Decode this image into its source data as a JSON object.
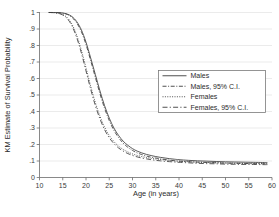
{
  "chart_data": {
    "type": "line",
    "title": "",
    "xlabel": "Age (in years)",
    "ylabel": "KM Estimate of Survival Probability",
    "xlim": [
      10,
      60
    ],
    "ylim": [
      0,
      1
    ],
    "xticks": [
      "10",
      "15",
      "20",
      "25",
      "30",
      "35",
      "40",
      "45",
      "50",
      "55",
      "60"
    ],
    "xtick_values": [
      10,
      15,
      20,
      25,
      30,
      35,
      40,
      45,
      50,
      55,
      60
    ],
    "yticks": [
      "0",
      ".1",
      ".2",
      ".3",
      ".4",
      ".5",
      ".6",
      ".7",
      ".8",
      ".9",
      "1"
    ],
    "ytick_values": [
      0,
      0.1,
      0.2,
      0.3,
      0.4,
      0.5,
      0.6,
      0.7,
      0.8,
      0.9,
      1
    ],
    "grid": "horizontal",
    "legend_position": "center-right",
    "legend": [
      {
        "label": "Males",
        "style": "solid"
      },
      {
        "label": "Males, 95% C.I.",
        "style": "dashdot"
      },
      {
        "label": "Females",
        "style": "dotted"
      },
      {
        "label": "Females, 95% C.I.",
        "style": "longdash"
      }
    ],
    "x": [
      12,
      13,
      14,
      15,
      16,
      17,
      18,
      19,
      20,
      21,
      22,
      23,
      24,
      25,
      26,
      27,
      28,
      29,
      30,
      31,
      32,
      33,
      34,
      35,
      36,
      37,
      38,
      39,
      40,
      42,
      44,
      46,
      48,
      50,
      52,
      54,
      56,
      58,
      59
    ],
    "series": [
      {
        "name": "Males",
        "style": "solid",
        "values": [
          1.0,
          1.0,
          0.999,
          0.997,
          0.99,
          0.975,
          0.945,
          0.895,
          0.82,
          0.725,
          0.625,
          0.525,
          0.435,
          0.36,
          0.3,
          0.255,
          0.22,
          0.195,
          0.175,
          0.16,
          0.149,
          0.14,
          0.133,
          0.127,
          0.122,
          0.118,
          0.114,
          0.111,
          0.108,
          0.104,
          0.101,
          0.099,
          0.097,
          0.095,
          0.094,
          0.093,
          0.092,
          0.091,
          0.091
        ]
      },
      {
        "name": "Males, 95% C.I.",
        "style": "dashdot",
        "values": [
          1.0,
          1.0,
          0.999,
          0.996,
          0.988,
          0.97,
          0.937,
          0.884,
          0.806,
          0.709,
          0.608,
          0.508,
          0.419,
          0.345,
          0.286,
          0.242,
          0.208,
          0.183,
          0.164,
          0.149,
          0.139,
          0.13,
          0.123,
          0.118,
          0.113,
          0.109,
          0.105,
          0.102,
          0.099,
          0.096,
          0.093,
          0.091,
          0.089,
          0.087,
          0.086,
          0.085,
          0.084,
          0.083,
          0.083
        ]
      },
      {
        "name": "Females",
        "style": "dotted",
        "values": [
          1.0,
          0.999,
          0.996,
          0.988,
          0.968,
          0.928,
          0.862,
          0.772,
          0.665,
          0.555,
          0.455,
          0.372,
          0.305,
          0.255,
          0.218,
          0.19,
          0.17,
          0.155,
          0.143,
          0.134,
          0.127,
          0.121,
          0.116,
          0.112,
          0.109,
          0.106,
          0.103,
          0.101,
          0.099,
          0.096,
          0.093,
          0.091,
          0.09,
          0.088,
          0.087,
          0.086,
          0.086,
          0.085,
          0.085
        ]
      },
      {
        "name": "Females, 95% C.I.",
        "style": "longdash",
        "values": [
          1.0,
          0.999,
          0.995,
          0.985,
          0.962,
          0.918,
          0.848,
          0.755,
          0.646,
          0.536,
          0.437,
          0.355,
          0.29,
          0.241,
          0.206,
          0.179,
          0.16,
          0.145,
          0.134,
          0.125,
          0.118,
          0.113,
          0.108,
          0.104,
          0.101,
          0.098,
          0.096,
          0.094,
          0.092,
          0.089,
          0.086,
          0.084,
          0.083,
          0.081,
          0.08,
          0.079,
          0.079,
          0.078,
          0.078
        ]
      }
    ]
  },
  "colors": {
    "curve": "#3c3c3c",
    "grid": "#e2e2e2",
    "axis": "#6b6b6b",
    "background": "#ffffff"
  }
}
